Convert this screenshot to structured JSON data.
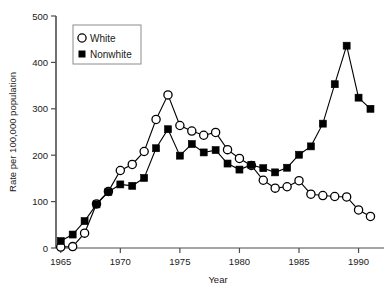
{
  "chart_data": {
    "type": "line",
    "title": "",
    "xlabel": "Year",
    "ylabel": "Rate per 100,000 population",
    "xlim": [
      1964.6,
      1991.8
    ],
    "ylim": [
      0,
      500
    ],
    "xticks": [
      1965,
      1970,
      1975,
      1980,
      1985,
      1990
    ],
    "xtick_labels": [
      "1965",
      "1970",
      "1975",
      "1980",
      "1985",
      "1990"
    ],
    "yticks": [
      0,
      100,
      200,
      300,
      400,
      500
    ],
    "ytick_labels": [
      "0",
      "100",
      "200",
      "300",
      "400",
      "500"
    ],
    "grid": false,
    "legend_position": "upper-left",
    "x": [
      1965,
      1966,
      1967,
      1968,
      1969,
      1970,
      1971,
      1972,
      1973,
      1974,
      1975,
      1976,
      1977,
      1978,
      1979,
      1980,
      1981,
      1982,
      1983,
      1984,
      1985,
      1986,
      1987,
      1988,
      1989,
      1990,
      1991
    ],
    "series": [
      {
        "name": "White",
        "marker": "open-circle",
        "color": "#000000",
        "values": [
          2,
          3,
          32,
          95,
          122,
          167,
          180,
          208,
          277,
          330,
          264,
          252,
          243,
          249,
          212,
          193,
          178,
          146,
          129,
          132,
          145,
          116,
          113,
          111,
          110,
          82,
          68
        ]
      },
      {
        "name": "Nonwhite",
        "marker": "filled-square",
        "color": "#000000",
        "values": [
          15,
          29,
          58,
          94,
          121,
          137,
          134,
          151,
          215,
          256,
          199,
          224,
          206,
          211,
          182,
          169,
          179,
          172,
          163,
          173,
          201,
          219,
          268,
          353,
          436,
          324,
          300
        ]
      }
    ]
  },
  "legend": {
    "entries": [
      {
        "label": "White",
        "marker": "open-circle"
      },
      {
        "label": "Nonwhite",
        "marker": "filled-square"
      }
    ]
  }
}
